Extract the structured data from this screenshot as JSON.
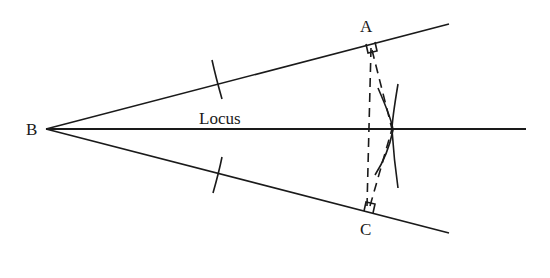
{
  "diagram": {
    "labels": {
      "vertex": "B",
      "upper_foot": "A",
      "lower_foot": "C",
      "bisector": "Locus"
    },
    "colors": {
      "line": "#1a1a1a",
      "background": "#ffffff"
    }
  }
}
